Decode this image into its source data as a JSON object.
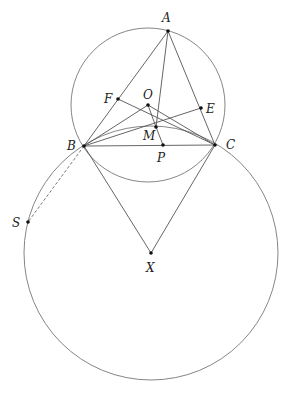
{
  "diagram": {
    "type": "geometry",
    "points": {
      "A": {
        "label": "A",
        "x": 168,
        "y": 31,
        "lx": 162,
        "ly": 22
      },
      "B": {
        "label": "B",
        "x": 84,
        "y": 146,
        "lx": 67,
        "ly": 150
      },
      "C": {
        "label": "C",
        "x": 215,
        "y": 145,
        "lx": 226,
        "ly": 149
      },
      "O": {
        "label": "O",
        "x": 148,
        "y": 105,
        "lx": 143,
        "ly": 99
      },
      "F": {
        "label": "F",
        "x": 118,
        "y": 99,
        "lx": 104,
        "ly": 103
      },
      "E": {
        "label": "E",
        "x": 201,
        "y": 108,
        "lx": 206,
        "ly": 113
      },
      "M": {
        "label": "M",
        "x": 156,
        "y": 127,
        "lx": 143,
        "ly": 140
      },
      "P": {
        "label": "P",
        "x": 163,
        "y": 145,
        "lx": 157,
        "ly": 162
      },
      "X": {
        "label": "X",
        "x": 151,
        "y": 253,
        "lx": 146,
        "ly": 272
      },
      "S": {
        "label": "S",
        "x": 28,
        "y": 222,
        "lx": 12,
        "ly": 227
      }
    },
    "circles": [
      {
        "name": "circumcircle-ABC",
        "cx": 148,
        "cy": 105,
        "r": 77
      },
      {
        "name": "circle-X",
        "cx": 151,
        "cy": 253,
        "r": 127
      }
    ],
    "segments": [
      [
        "A",
        "B"
      ],
      [
        "A",
        "C"
      ],
      [
        "B",
        "C"
      ],
      [
        "A",
        "M"
      ],
      [
        "M",
        "P"
      ],
      [
        "B",
        "O"
      ],
      [
        "O",
        "C"
      ],
      [
        "O",
        "M"
      ],
      [
        "F",
        "C"
      ],
      [
        "B",
        "E"
      ],
      [
        "B",
        "X"
      ],
      [
        "C",
        "X"
      ]
    ],
    "dashed_segments": [
      [
        "B",
        "S"
      ]
    ]
  }
}
